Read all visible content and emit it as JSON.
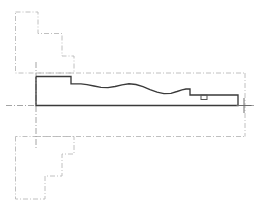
{
  "drawing": {
    "title": "Longitudinal Section Profile",
    "type": "technical-line-drawing",
    "canvas": {
      "width": 262,
      "height": 214
    },
    "background_color": "#ffffff",
    "colors": {
      "profile_line": "#3a3a3a",
      "construction_line": "#b9b9b9",
      "centerline": "#9a9a9a",
      "marker": "#555555",
      "crosshair": "#6e6e6e"
    },
    "line_styles": {
      "profile": "solid",
      "construction": "dash-dot",
      "centerline": "dash-dot"
    },
    "paths": {
      "upper_left_construction": "M 15.5 12 L 38 12 L 38 33.5 L 62 33.5 L 62 56 L 74 56 L 74 73 L 15.5 73 L 15.5 12",
      "lower_left_construction": "M 15.5 136.5 L 15.5 199 L 45 199 L 45 176 L 62 176 L 62 154 L 74 154 L 74 136.5 L 15.5 136.5",
      "upper_boundary": "M 36 73 L 245 73",
      "right_boundary": "M 245 73 L 245 136.5",
      "lower_boundary": "M 36 136.5 L 245 136.5",
      "centerline_horizontal": "M 6 105.5 L 256 105.5",
      "centerline_vertical_left": "M 36 62 L 36 148",
      "profile_outline": "M 36 76.5 L 36 105.5 L 238 105.5 L 238 95 L 190 95 L 190 89 L 186 89 L 182 89.8 L 177 91.5 L 171 93.3 L 164 93.6 L 157 92.2 L 150 89.6 L 143 86.6 L 136 84.5 L 129 83.8 L 122 84.8 L 115 86.5 L 108 87.6 L 101 87.3 L 94 86 L 87 84.6 L 81 83.8 L 71 83.8 L 71 76.5 L 36 76.5",
      "marker_rect": {
        "x": 201,
        "y": 95,
        "width": 6,
        "height": 4.5
      },
      "crosshair_center": {
        "x": 244,
        "y": 105.5,
        "arm": 7.5
      }
    },
    "features": [
      {
        "name": "left-step-riser",
        "kind": "vertical-step"
      },
      {
        "name": "upper-shelf",
        "kind": "horizontal-ledge"
      },
      {
        "name": "wave-segment",
        "kind": "undulating-profile"
      },
      {
        "name": "right-step",
        "kind": "vertical-step"
      },
      {
        "name": "end-wall",
        "kind": "vertical-terminus"
      }
    ]
  }
}
